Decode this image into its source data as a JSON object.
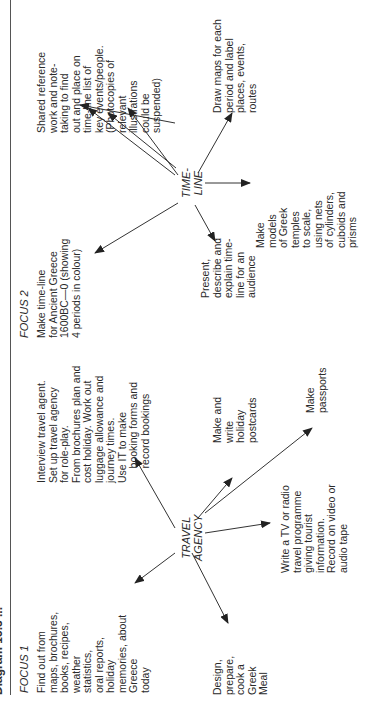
{
  "title": "Diagram 15.3 ...",
  "focus1": {
    "label": "FOCUS 1",
    "hub": "TRAVEL\nAGENCY",
    "nodes": [
      "Find out from\nmaps, brochures,\nbooks, recipes,\nweather\nstatistics,\noral reports,\nholiday\nmemories, about\nGreece\ntoday",
      "Interview travel agent.\nSet up travel agency\nfor role-play.\nFrom brochures plan and\ncost holiday. Work out\nluggage allowance and\njourney times.\nUse IT to make\n     booking forms and\n     record bookings",
      "Make and\nwrite\nholiday\npostcards",
      "Make\npassports",
      "Write a TV or radio\ntravel programme\ngiving tourist\ninformation.\nRecord on video or\naudio tape",
      "Design,\nprepare,\ncook a\nGreek\nMeal"
    ]
  },
  "focus2": {
    "label": "FOCUS 2",
    "hub": "TIME-\nLINE",
    "nodes": [
      "Make time-line\nfor Ancient Greece\n1600BC—0 (showing\n4 periods in colour)",
      "Shared reference\nwork and note-\ntaking to find\nout and place on\ntime-line list of\nkey events/people.\n(Photocopies of\nrelevant\nillustrations\ncould be\nsuspended)",
      "Draw maps for each\nperiod and label\nplaces, events,\nroutes",
      "Make\nmodels\nof Greek\ntemples\nto scale,\nusing nets\nof cylinders,\ncuboids and\nprisms",
      "Present,\ndescribe and\nexplain time-\nline for an\naudience"
    ]
  }
}
